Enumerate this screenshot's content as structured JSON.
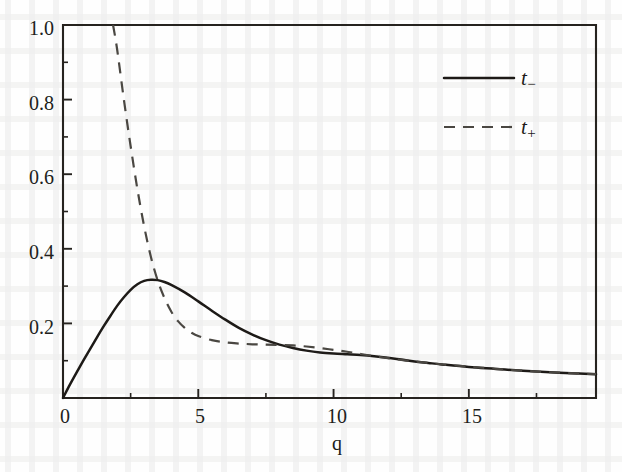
{
  "chart_data": {
    "type": "line",
    "title": "",
    "xlabel": "q",
    "ylabel": "",
    "xlim": [
      0,
      19.7
    ],
    "ylim": [
      0,
      1.0
    ],
    "grid": false,
    "legend_position": "top-right",
    "x_ticks": [
      0,
      5,
      10,
      15
    ],
    "x_tick_labels": [
      "0",
      "5",
      "10",
      "15"
    ],
    "x_minor_ticks": [
      2.5,
      7.5,
      12.5,
      17.5
    ],
    "y_ticks": [
      0.2,
      0.4,
      0.6,
      0.8,
      1.0
    ],
    "y_tick_labels": [
      "0.2",
      "0.4",
      "0.6",
      "0.8",
      "1.0"
    ],
    "y_minor_ticks": [
      0.1,
      0.3,
      0.5,
      0.7,
      0.9
    ],
    "series": [
      {
        "name": "t_minus",
        "legend_label": "t",
        "legend_sub": "−",
        "style": "solid",
        "color": "#1d1a17",
        "x": [
          0.0,
          0.25,
          0.5,
          0.75,
          1.0,
          1.25,
          1.5,
          1.75,
          2.0,
          2.25,
          2.5,
          2.75,
          3.0,
          3.25,
          3.5,
          3.75,
          4.0,
          4.5,
          5.0,
          5.5,
          6.0,
          6.5,
          7.0,
          7.5,
          8.0,
          8.5,
          9.0,
          9.5,
          10.0,
          10.5,
          11.0,
          11.5,
          12.0,
          12.5,
          13.0,
          13.5,
          14.0,
          15.0,
          16.0,
          17.0,
          18.0,
          19.0,
          19.7
        ],
        "y": [
          0.0,
          0.035,
          0.068,
          0.1,
          0.131,
          0.162,
          0.192,
          0.22,
          0.247,
          0.27,
          0.29,
          0.305,
          0.314,
          0.317,
          0.316,
          0.311,
          0.303,
          0.283,
          0.259,
          0.234,
          0.21,
          0.188,
          0.17,
          0.155,
          0.143,
          0.134,
          0.127,
          0.122,
          0.119,
          0.117,
          0.115,
          0.112,
          0.108,
          0.103,
          0.098,
          0.094,
          0.09,
          0.083,
          0.078,
          0.073,
          0.069,
          0.066,
          0.064
        ]
      },
      {
        "name": "t_plus",
        "legend_label": "t",
        "legend_sub": "+",
        "style": "dashed",
        "color": "#4a4742",
        "x": [
          1.85,
          2.0,
          2.25,
          2.5,
          2.75,
          3.0,
          3.25,
          3.5,
          3.75,
          4.0,
          4.25,
          4.5,
          4.75,
          5.0,
          5.5,
          6.0,
          6.5,
          7.0,
          7.5,
          8.0,
          8.5,
          9.0,
          9.5,
          10.0,
          10.5,
          11.0,
          11.5,
          12.0,
          12.5,
          13.0,
          13.5,
          14.0,
          15.0,
          16.0,
          17.0,
          18.0,
          19.0,
          19.7
        ],
        "y": [
          1.0,
          0.935,
          0.8,
          0.675,
          0.56,
          0.46,
          0.378,
          0.315,
          0.268,
          0.232,
          0.206,
          0.188,
          0.175,
          0.166,
          0.155,
          0.149,
          0.146,
          0.144,
          0.143,
          0.142,
          0.141,
          0.138,
          0.134,
          0.129,
          0.124,
          0.118,
          0.112,
          0.107,
          0.102,
          0.098,
          0.094,
          0.09,
          0.084,
          0.078,
          0.073,
          0.069,
          0.066,
          0.064
        ]
      }
    ],
    "annotations": []
  },
  "legend": {
    "entries": [
      {
        "label": "t",
        "sub": "−",
        "style": "solid"
      },
      {
        "label": "t",
        "sub": "+",
        "style": "dashed"
      }
    ]
  },
  "axis": {
    "x_title": "q"
  }
}
